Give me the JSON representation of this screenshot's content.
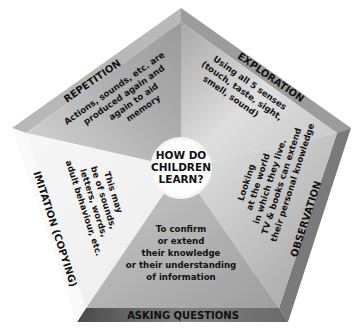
{
  "diagram": {
    "center": {
      "lines": [
        "HOW DO",
        "CHILDREN",
        "LEARN?"
      ]
    },
    "segments": [
      {
        "title": "REPETITION",
        "lines": [
          "Actions, sounds, etc. are",
          "produced again and",
          "again to aid",
          "memory"
        ]
      },
      {
        "title": "EXPLORATION",
        "lines": [
          "Using all 5 senses",
          "(touch, taste, sight,",
          "smell, sound)"
        ]
      },
      {
        "title": "OBSERVATION",
        "lines": [
          "Looking",
          "at the world",
          "in which they live.",
          "TV & books can extend",
          "their personal knowledge"
        ]
      },
      {
        "title": "ASKING QUESTIONS",
        "lines": [
          "To confirm",
          "or extend",
          "their knowledge",
          "or their understanding",
          "of information"
        ]
      },
      {
        "title": "IMITATION (COPYING)",
        "lines": [
          "This may",
          "be of sounds,",
          "letters, words,",
          "adult behaviour, etc."
        ]
      }
    ],
    "colors": {
      "repetition": "#b4b4b4",
      "exploration": "#cfcfcf",
      "observation": "#c2c2c2",
      "asking": "#a9a9a9",
      "imitation": "#f2f2f2",
      "bevel_dark": "#6e6e6e",
      "center_circle": "#ffffff"
    }
  }
}
